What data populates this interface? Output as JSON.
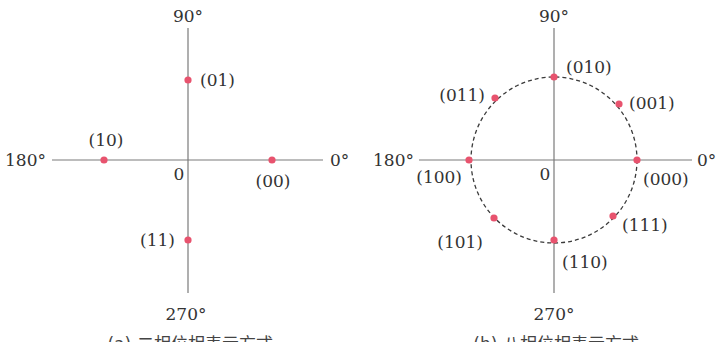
{
  "figure": {
    "colors": {
      "point": "#e8536e",
      "axis": "#7a7a7a",
      "text": "#333333",
      "ring": "#3a3a3a"
    },
    "panels": [
      {
        "id": "a",
        "caption": "(a) 二相位相表示方式",
        "origin_label": "0",
        "angle_labels": {
          "deg0": "0°",
          "deg90": "90°",
          "deg180": "180°",
          "deg270": "270°"
        },
        "points": [
          {
            "code": "(00)",
            "angle_deg": 0
          },
          {
            "code": "(01)",
            "angle_deg": 90
          },
          {
            "code": "(10)",
            "angle_deg": 180
          },
          {
            "code": "(11)",
            "angle_deg": 270
          }
        ],
        "has_circle": false
      },
      {
        "id": "b",
        "caption": "(b) 八相位相表示方式",
        "origin_label": "0",
        "angle_labels": {
          "deg0": "0°",
          "deg90": "90°",
          "deg180": "180°",
          "deg270": "270°"
        },
        "points": [
          {
            "code": "(000)",
            "angle_deg": 0
          },
          {
            "code": "(001)",
            "angle_deg": 45
          },
          {
            "code": "(010)",
            "angle_deg": 90
          },
          {
            "code": "(011)",
            "angle_deg": 135
          },
          {
            "code": "(100)",
            "angle_deg": 180
          },
          {
            "code": "(101)",
            "angle_deg": 225
          },
          {
            "code": "(110)",
            "angle_deg": 270
          },
          {
            "code": "(111)",
            "angle_deg": 315
          }
        ],
        "has_circle": true,
        "circle_style": "dashed"
      }
    ]
  }
}
